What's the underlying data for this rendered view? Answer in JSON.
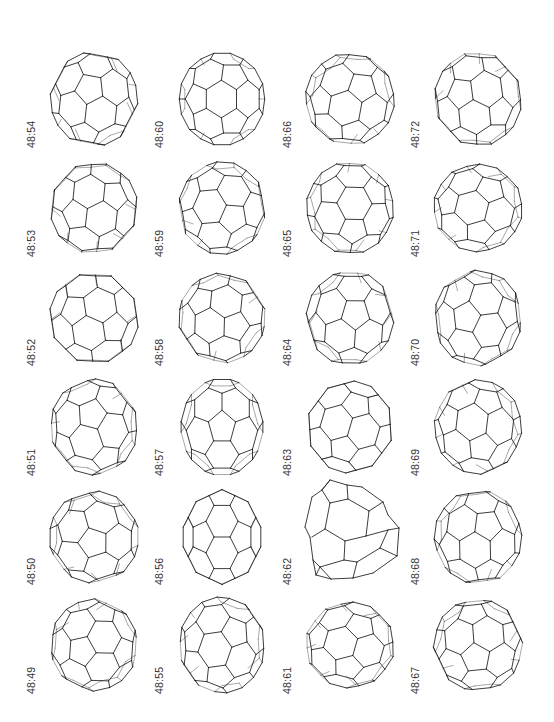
{
  "figure": {
    "type": "grid of fullerene cage isomers",
    "columns": 4,
    "rows": 6,
    "layout": {
      "col_label_x": [
        27,
        155,
        283,
        411
      ],
      "row_label_bottom_y": [
        148,
        257,
        366,
        476,
        585,
        694
      ],
      "cage_center_x": [
        94,
        222,
        350,
        478
      ],
      "cage_center_y": [
        99,
        208,
        318,
        427,
        537,
        645
      ],
      "cage_radius": 44
    },
    "cells": [
      {
        "label": "48:54",
        "col": 0,
        "row": 0,
        "rx": 0.4,
        "ry": 0.9,
        "rz": 0.2,
        "sx": 1.0,
        "sy": 1.08
      },
      {
        "label": "48:53",
        "col": 0,
        "row": 1,
        "rx": 1.1,
        "ry": 0.3,
        "rz": 0.6,
        "sx": 1.0,
        "sy": 1.05
      },
      {
        "label": "48:52",
        "col": 0,
        "row": 2,
        "rx": 0.7,
        "ry": 1.6,
        "rz": 1.1,
        "sx": 1.02,
        "sy": 1.06
      },
      {
        "label": "48:51",
        "col": 0,
        "row": 3,
        "rx": 1.9,
        "ry": 0.5,
        "rz": 0.1,
        "sx": 1.0,
        "sy": 1.1
      },
      {
        "label": "48:50",
        "col": 0,
        "row": 4,
        "rx": 0.2,
        "ry": 2.2,
        "rz": 0.8,
        "sx": 1.03,
        "sy": 1.05
      },
      {
        "label": "48:49",
        "col": 0,
        "row": 5,
        "rx": 2.5,
        "ry": 1.2,
        "rz": 1.4,
        "sx": 1.0,
        "sy": 1.05
      },
      {
        "label": "48:60",
        "col": 1,
        "row": 0,
        "rx": 0.0,
        "ry": 0.35,
        "rz": 0.0,
        "sx": 0.98,
        "sy": 1.06
      },
      {
        "label": "48:59",
        "col": 1,
        "row": 1,
        "rx": 1.4,
        "ry": 0.9,
        "rz": 0.3,
        "sx": 1.0,
        "sy": 1.06
      },
      {
        "label": "48:58",
        "col": 1,
        "row": 2,
        "rx": 0.9,
        "ry": 0.2,
        "rz": 1.6,
        "sx": 1.0,
        "sy": 1.03
      },
      {
        "label": "48:57",
        "col": 1,
        "row": 3,
        "rx": 0.55,
        "ry": 0.0,
        "rz": 0.0,
        "sx": 0.95,
        "sy": 1.12
      },
      {
        "label": "48:56",
        "col": 1,
        "row": 4,
        "rx": 1.5708,
        "ry": 0.0,
        "rz": 0.0,
        "sx": 0.9,
        "sy": 1.1
      },
      {
        "label": "48:55",
        "col": 1,
        "row": 5,
        "rx": 2.1,
        "ry": 0.6,
        "rz": 0.9,
        "sx": 0.98,
        "sy": 1.1
      },
      {
        "label": "48:66",
        "col": 2,
        "row": 0,
        "rx": 0.8,
        "ry": 1.3,
        "rz": 0.5,
        "sx": 1.02,
        "sy": 1.05
      },
      {
        "label": "48:65",
        "col": 2,
        "row": 1,
        "rx": 1.2,
        "ry": 2.0,
        "rz": 0.2,
        "sx": 1.0,
        "sy": 1.05
      },
      {
        "label": "48:64",
        "col": 2,
        "row": 2,
        "rx": 0.3,
        "ry": 1.0,
        "rz": 1.2,
        "sx": 1.0,
        "sy": 1.08
      },
      {
        "label": "48:63",
        "col": 2,
        "row": 3,
        "rx": 0.0,
        "ry": 0.0,
        "rz": 0.3,
        "sx": 1.0,
        "sy": 1.05
      },
      {
        "label": "48:62",
        "col": 2,
        "row": 4,
        "rx": 0.0,
        "ry": 0.0,
        "rz": 0.0,
        "sx": 1.0,
        "sy": 1.0,
        "simple": true
      },
      {
        "label": "48:61",
        "col": 2,
        "row": 5,
        "rx": 1.7,
        "ry": 1.7,
        "rz": 0.4,
        "sx": 1.02,
        "sy": 0.98
      },
      {
        "label": "48:72",
        "col": 3,
        "row": 0,
        "rx": 0.25,
        "ry": 0.6,
        "rz": 0.0,
        "sx": 1.0,
        "sy": 1.08
      },
      {
        "label": "48:71",
        "col": 3,
        "row": 1,
        "rx": 0.9,
        "ry": 2.4,
        "rz": 0.7,
        "sx": 1.02,
        "sy": 1.0
      },
      {
        "label": "48:70",
        "col": 3,
        "row": 2,
        "rx": 1.3,
        "ry": 0.4,
        "rz": 1.0,
        "sx": 1.0,
        "sy": 1.1
      },
      {
        "label": "48:69",
        "col": 3,
        "row": 3,
        "rx": 0.1,
        "ry": 0.2,
        "rz": 0.15,
        "sx": 1.0,
        "sy": 1.08
      },
      {
        "label": "48:68",
        "col": 3,
        "row": 4,
        "rx": 0.6,
        "ry": 0.9,
        "rz": 1.3,
        "sx": 1.0,
        "sy": 1.08
      },
      {
        "label": "48:67",
        "col": 3,
        "row": 5,
        "rx": 2.3,
        "ry": 0.1,
        "rz": 0.5,
        "sx": 1.02,
        "sy": 1.05
      }
    ],
    "simple_cage_48_62": {
      "outline": [
        [
          330,
          480
        ],
        [
          347,
          485
        ],
        [
          362,
          487
        ],
        [
          383,
          502
        ],
        [
          388,
          515
        ],
        [
          399,
          528
        ],
        [
          397,
          556
        ],
        [
          373,
          573
        ],
        [
          353,
          578
        ],
        [
          331,
          579
        ],
        [
          316,
          575
        ],
        [
          313,
          560
        ],
        [
          310,
          537
        ],
        [
          305,
          527
        ],
        [
          312,
          497
        ],
        [
          322,
          490
        ]
      ],
      "edges": [
        [
          [
            322,
            490
          ],
          [
            330,
            480
          ]
        ],
        [
          [
            322,
            490
          ],
          [
            330,
            503
          ]
        ],
        [
          [
            330,
            503
          ],
          [
            348,
            499
          ]
        ],
        [
          [
            348,
            499
          ],
          [
            347,
            485
          ]
        ],
        [
          [
            348,
            499
          ],
          [
            369,
            511
          ]
        ],
        [
          [
            369,
            511
          ],
          [
            383,
            502
          ]
        ],
        [
          [
            369,
            511
          ],
          [
            366,
            536
          ]
        ],
        [
          [
            366,
            536
          ],
          [
            388,
            530
          ]
        ],
        [
          [
            388,
            530
          ],
          [
            399,
            528
          ]
        ],
        [
          [
            366,
            536
          ],
          [
            345,
            541
          ]
        ],
        [
          [
            345,
            541
          ],
          [
            325,
            529
          ]
        ],
        [
          [
            325,
            529
          ],
          [
            330,
            503
          ]
        ],
        [
          [
            325,
            529
          ],
          [
            312,
            537
          ]
        ],
        [
          [
            345,
            541
          ],
          [
            344,
            560
          ]
        ],
        [
          [
            344,
            560
          ],
          [
            320,
            567
          ]
        ],
        [
          [
            320,
            567
          ],
          [
            316,
            575
          ]
        ],
        [
          [
            344,
            560
          ],
          [
            357,
            562
          ]
        ],
        [
          [
            357,
            562
          ],
          [
            380,
            548
          ]
        ],
        [
          [
            380,
            548
          ],
          [
            388,
            530
          ]
        ],
        [
          [
            380,
            548
          ],
          [
            397,
            556
          ]
        ],
        [
          [
            357,
            562
          ],
          [
            353,
            578
          ]
        ],
        [
          [
            320,
            567
          ],
          [
            331,
            579
          ]
        ],
        [
          [
            313,
            560
          ],
          [
            320,
            567
          ]
        ]
      ]
    }
  }
}
